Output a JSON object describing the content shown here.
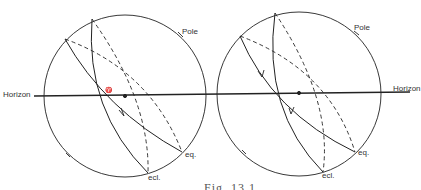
{
  "figure": {
    "caption": "Fig. 13.1",
    "labels": {
      "horizon_left": "Horizon",
      "horizon_right": "Horizon",
      "pole_left": "Pole",
      "pole_right": "Pole",
      "eq_left": "eq.",
      "eq_right": "eq.",
      "ecl_left": "ecl.",
      "ecl_right": "ecl.",
      "vernal_symbol": "♈"
    },
    "colors": {
      "line": "#222222",
      "background": "#ffffff"
    }
  }
}
